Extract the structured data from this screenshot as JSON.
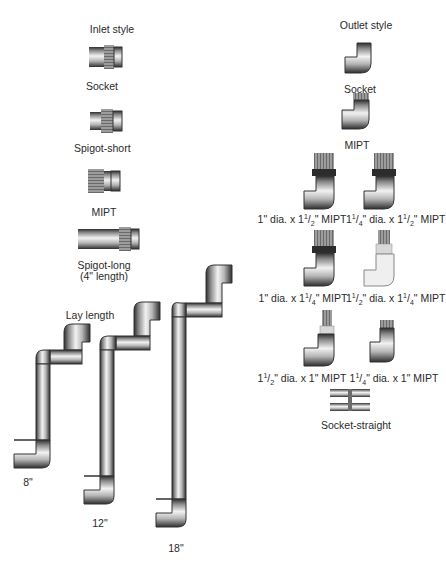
{
  "inlet": {
    "heading": "Inlet style",
    "items": [
      {
        "label": "Socket"
      },
      {
        "label": "Spigot-short"
      },
      {
        "label": "MIPT"
      },
      {
        "label": "Spigot-long",
        "sublabel": "(4\" length)"
      }
    ]
  },
  "outlet": {
    "heading": "Outlet style",
    "items": [
      {
        "label": "Socket"
      },
      {
        "label": "MIPT"
      }
    ],
    "mipt_variants": [
      {
        "dia_whole": "1",
        "dia_frac": "",
        "thread_whole": "1",
        "thread_frac": "1/2",
        "text": "1\" dia. x 1½\" MIPT"
      },
      {
        "dia_whole": "1",
        "dia_frac": "1/4",
        "thread_whole": "1",
        "thread_frac": "1/2",
        "text": "1¼\" dia. x 1½\" MIPT"
      },
      {
        "dia_whole": "1",
        "dia_frac": "",
        "thread_whole": "1",
        "thread_frac": "1/4",
        "text": "1\" dia. x 1¼\" MIPT"
      },
      {
        "dia_whole": "1",
        "dia_frac": "1/2",
        "thread_whole": "1",
        "thread_frac": "1/4",
        "text": "1½\" dia. x 1¼\" MIPT"
      },
      {
        "dia_whole": "1",
        "dia_frac": "1/2",
        "thread_whole": "1",
        "thread_frac": "",
        "text": "1½\" dia. x 1\" MIPT"
      },
      {
        "dia_whole": "1",
        "dia_frac": "1/4",
        "thread_whole": "1",
        "thread_frac": "",
        "text": "1¼\" dia. x 1\" MIPT"
      }
    ],
    "straight": {
      "label": "Socket-straight"
    }
  },
  "lay_length": {
    "heading": "Lay length",
    "sizes": [
      {
        "label": "8\""
      },
      {
        "label": "12\""
      },
      {
        "label": "18\""
      }
    ]
  },
  "colors": {
    "pipe_dark": "#3a3a3a",
    "pipe_mid": "#9a9a9a",
    "pipe_light": "#e6e6e6",
    "thread": "#8c8c8c",
    "text": "#2a2a2a"
  }
}
